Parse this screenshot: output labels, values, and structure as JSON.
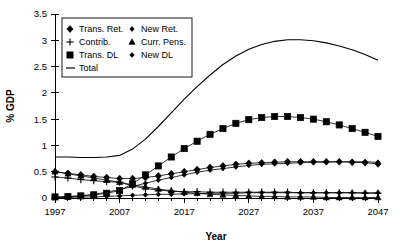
{
  "chart_data": {
    "type": "line",
    "title": "",
    "xlabel": "Year",
    "ylabel": "% GDP",
    "xlim": [
      1997,
      2047
    ],
    "ylim": [
      0,
      3.5
    ],
    "ytick_labels": [
      "0",
      "0.5",
      "1",
      "1.5",
      "2",
      "2.5",
      "3",
      "3.5"
    ],
    "ytick_values": [
      0,
      0.5,
      1,
      1.5,
      2,
      2.5,
      3,
      3.5
    ],
    "xtick_labels": [
      "1997",
      "2007",
      "2017",
      "2027",
      "2037",
      "2047"
    ],
    "xtick_values": [
      1997,
      2007,
      2017,
      2027,
      2037,
      2047
    ],
    "grid": false,
    "legend_position": "top-left",
    "x": [
      1997,
      1999,
      2001,
      2003,
      2005,
      2007,
      2009,
      2011,
      2013,
      2015,
      2017,
      2019,
      2021,
      2023,
      2025,
      2027,
      2029,
      2031,
      2033,
      2035,
      2037,
      2039,
      2041,
      2043,
      2045,
      2047
    ],
    "series": [
      {
        "name": "Trans. Ret.",
        "marker": "diamond",
        "values": [
          0.5,
          0.47,
          0.44,
          0.41,
          0.39,
          0.37,
          0.37,
          0.39,
          0.42,
          0.46,
          0.5,
          0.54,
          0.58,
          0.61,
          0.64,
          0.66,
          0.67,
          0.68,
          0.69,
          0.69,
          0.69,
          0.69,
          0.69,
          0.68,
          0.67,
          0.65
        ]
      },
      {
        "name": "New Ret.",
        "marker": "diamond-small",
        "values": [
          0.01,
          0.02,
          0.04,
          0.07,
          0.11,
          0.16,
          0.22,
          0.28,
          0.34,
          0.39,
          0.44,
          0.49,
          0.53,
          0.56,
          0.59,
          0.62,
          0.64,
          0.65,
          0.66,
          0.67,
          0.68,
          0.68,
          0.69,
          0.69,
          0.69,
          0.68
        ]
      },
      {
        "name": "Contrib.",
        "marker": "plus",
        "values": [
          0.4,
          0.38,
          0.35,
          0.33,
          0.31,
          0.3,
          0.23,
          0.18,
          0.15,
          0.13,
          0.12,
          0.12,
          0.11,
          0.11,
          0.11,
          0.11,
          0.11,
          0.11,
          0.11,
          0.1,
          0.1,
          0.1,
          0.1,
          0.1,
          0.09,
          0.09
        ]
      },
      {
        "name": "Curr. Pens.",
        "marker": "triangle",
        "values": [
          0.5,
          0.46,
          0.42,
          0.38,
          0.34,
          0.3,
          0.25,
          0.21,
          0.17,
          0.14,
          0.11,
          0.09,
          0.07,
          0.06,
          0.05,
          0.04,
          0.03,
          0.03,
          0.02,
          0.02,
          0.02,
          0.01,
          0.01,
          0.01,
          0.01,
          0.01
        ]
      },
      {
        "name": "Trans. DL",
        "marker": "square",
        "values": [
          0.02,
          0.03,
          0.04,
          0.06,
          0.09,
          0.14,
          0.27,
          0.44,
          0.61,
          0.78,
          0.94,
          1.08,
          1.21,
          1.32,
          1.42,
          1.49,
          1.53,
          1.55,
          1.55,
          1.53,
          1.5,
          1.45,
          1.39,
          1.32,
          1.25,
          1.17
        ]
      },
      {
        "name": "New  DL",
        "marker": "diamond-small",
        "values": [
          0.01,
          0.01,
          0.02,
          0.02,
          0.03,
          0.04,
          0.05,
          0.06,
          0.07,
          0.07,
          0.08,
          0.08,
          0.09,
          0.09,
          0.09,
          0.1,
          0.1,
          0.1,
          0.1,
          0.1,
          0.1,
          0.1,
          0.1,
          0.1,
          0.1,
          0.1
        ]
      },
      {
        "name": "Total",
        "marker": "none",
        "values": [
          0.78,
          0.78,
          0.77,
          0.77,
          0.78,
          0.81,
          0.93,
          1.12,
          1.36,
          1.62,
          1.88,
          2.12,
          2.34,
          2.54,
          2.7,
          2.83,
          2.92,
          2.98,
          3.01,
          3.01,
          2.99,
          2.95,
          2.89,
          2.82,
          2.73,
          2.62
        ]
      }
    ]
  },
  "legend": {
    "entries": [
      {
        "label": "Trans. Ret.",
        "marker": "diamond",
        "column": 0,
        "row": 0
      },
      {
        "label": "New Ret.",
        "marker": "diamond-small",
        "column": 1,
        "row": 0
      },
      {
        "label": "Contrib.",
        "marker": "plus",
        "column": 0,
        "row": 1
      },
      {
        "label": "Curr. Pens.",
        "marker": "triangle",
        "column": 1,
        "row": 1
      },
      {
        "label": "Trans. DL",
        "marker": "square",
        "column": 0,
        "row": 2
      },
      {
        "label": "New  DL",
        "marker": "diamond-small",
        "column": 1,
        "row": 2
      },
      {
        "label": "Total",
        "marker": "line",
        "column": 0,
        "row": 3
      }
    ]
  },
  "axes": {
    "y_title": "% GDP",
    "x_title": "Year"
  }
}
